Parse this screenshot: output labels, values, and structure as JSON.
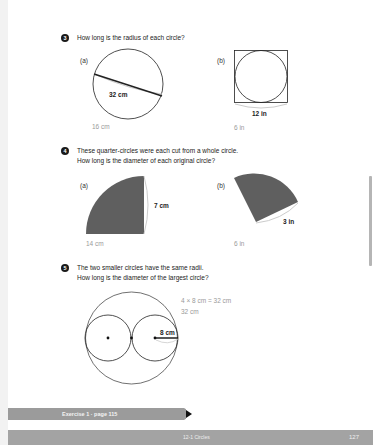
{
  "questions": [
    {
      "number": "3",
      "text": "How long is the radius of each circle?",
      "parts": [
        {
          "label": "(a)",
          "measure": "32 cm",
          "answer": "16 cm"
        },
        {
          "label": "(b)",
          "measure": "12 in",
          "answer": "6 in"
        }
      ]
    },
    {
      "number": "4",
      "text_line1": "These quarter-circles were each cut from a whole circle.",
      "text_line2": "How long is the diameter of each original circle?",
      "parts": [
        {
          "label": "(a)",
          "measure": "7 cm",
          "answer": "14 cm"
        },
        {
          "label": "(b)",
          "measure": "3 in",
          "answer": "6 in"
        }
      ]
    },
    {
      "number": "5",
      "text_line1": "The two smaller circles have the same radii.",
      "text_line2": "How long is the diameter of the largest circle?",
      "measure": "8 cm",
      "answer_line1": "4 × 8 cm = 32 cm",
      "answer_line2": "32 cm"
    }
  ],
  "exercise_tab": {
    "label": "Exercise 1 · page 115"
  },
  "footer": {
    "section": "12-1 Circles",
    "page_number": "127"
  },
  "colors": {
    "answer_text": "#9a9a9a",
    "shape_fill": "#5f5f5f",
    "bar": "#a3a3a3"
  }
}
